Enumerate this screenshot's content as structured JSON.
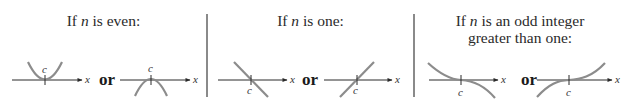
{
  "panels": [
    {
      "id": "even",
      "title_prefix": "If ",
      "title_var": "n",
      "title_suffix": " is even:",
      "connector": "or",
      "graphs": [
        {
          "shape": "parabola-up",
          "axis_label": "x",
          "point_label": "c"
        },
        {
          "shape": "parabola-down",
          "axis_label": "x",
          "point_label": "c"
        }
      ]
    },
    {
      "id": "one",
      "title_prefix": "If ",
      "title_var": "n",
      "title_suffix": " is one:",
      "connector": "or",
      "graphs": [
        {
          "shape": "line-decreasing",
          "axis_label": "x",
          "point_label": "c"
        },
        {
          "shape": "line-increasing",
          "axis_label": "x",
          "point_label": "c"
        }
      ]
    },
    {
      "id": "odd",
      "title_prefix": "If ",
      "title_var": "n",
      "title_suffix": " is an odd integer",
      "title_line2": "greater than one:",
      "connector": "or",
      "graphs": [
        {
          "shape": "cubic-decreasing",
          "axis_label": "x",
          "point_label": "c"
        },
        {
          "shape": "cubic-increasing",
          "axis_label": "x",
          "point_label": "c"
        }
      ]
    }
  ],
  "colors": {
    "curve": "#8c8c8c",
    "axis": "#2a2a2a",
    "divider": "#8a8a8a"
  }
}
